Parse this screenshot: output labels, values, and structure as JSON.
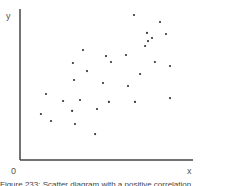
{
  "chart_data": {
    "type": "scatter",
    "title": "",
    "xlabel": "x",
    "ylabel": "y",
    "origin_label": "0",
    "xlim": [
      0,
      10
    ],
    "ylim": [
      0,
      10
    ],
    "grid": false,
    "legend": null,
    "tick_labels": false,
    "trend": "positive correlation",
    "points": [
      {
        "x": 6.59,
        "y": 9.67
      },
      {
        "x": 8.09,
        "y": 9.2
      },
      {
        "x": 7.34,
        "y": 8.47
      },
      {
        "x": 7.63,
        "y": 8.13
      },
      {
        "x": 8.44,
        "y": 8.4
      },
      {
        "x": 7.4,
        "y": 7.93
      },
      {
        "x": 7.23,
        "y": 7.6
      },
      {
        "x": 6.13,
        "y": 7.0
      },
      {
        "x": 4.97,
        "y": 6.93
      },
      {
        "x": 8.67,
        "y": 6.27
      },
      {
        "x": 3.64,
        "y": 7.33
      },
      {
        "x": 5.26,
        "y": 6.53
      },
      {
        "x": 6.94,
        "y": 5.73
      },
      {
        "x": 7.8,
        "y": 6.53
      },
      {
        "x": 3.87,
        "y": 5.93
      },
      {
        "x": 3.12,
        "y": 5.33
      },
      {
        "x": 4.8,
        "y": 5.13
      },
      {
        "x": 6.24,
        "y": 4.93
      },
      {
        "x": 6.65,
        "y": 3.87
      },
      {
        "x": 1.5,
        "y": 4.4
      },
      {
        "x": 2.49,
        "y": 3.93
      },
      {
        "x": 3.47,
        "y": 4.0
      },
      {
        "x": 3.01,
        "y": 3.27
      },
      {
        "x": 4.45,
        "y": 3.4
      },
      {
        "x": 1.21,
        "y": 3.07
      },
      {
        "x": 1.79,
        "y": 2.6
      },
      {
        "x": 3.18,
        "y": 2.4
      },
      {
        "x": 5.14,
        "y": 3.87
      },
      {
        "x": 8.67,
        "y": 4.13
      },
      {
        "x": 4.34,
        "y": 1.73
      },
      {
        "x": 3.06,
        "y": 6.47
      }
    ]
  },
  "caption": "Figure 233: Scatter diagram with a positive correlation"
}
